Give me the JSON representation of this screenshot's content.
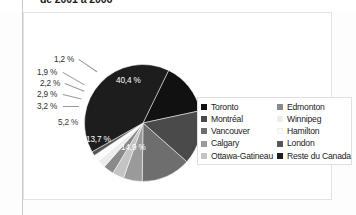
{
  "title": "de 2001 à 2006",
  "legend": {
    "columns": [
      {
        "items": [
          {
            "label": "Toronto",
            "color": "#111111"
          },
          {
            "label": "Montréal",
            "color": "#4a4a4a"
          },
          {
            "label": "Vancouver",
            "color": "#6e6e6e"
          },
          {
            "label": "Calgary",
            "color": "#9a9a9a"
          },
          {
            "label": "Ottawa-Gatineau",
            "color": "#c4c4c4"
          }
        ]
      },
      {
        "items": [
          {
            "label": "Edmonton",
            "color": "#8a8a8a"
          },
          {
            "label": "Winnipeg",
            "color": "#ececec"
          },
          {
            "label": "Hamilton",
            "color": "#fbfbfb"
          },
          {
            "label": "London",
            "color": "#565656"
          },
          {
            "label": "Reste du Canada",
            "color": "#1d1d1d"
          }
        ]
      }
    ]
  },
  "chart_data": {
    "type": "pie",
    "title": "de 2001 à 2006",
    "xlabel": "",
    "ylabel": "",
    "units": "percent",
    "decimal_separator": ",",
    "legend_position": "right",
    "grid": false,
    "categories": [
      "Toronto",
      "Montréal",
      "Vancouver",
      "Calgary",
      "Ottawa-Gatineau",
      "Edmonton",
      "Winnipeg",
      "Hamilton",
      "London",
      "Reste du Canada"
    ],
    "values": [
      14.4,
      14.9,
      13.7,
      5.2,
      3.2,
      2.9,
      2.2,
      1.9,
      1.2,
      40.4
    ],
    "colors": [
      "#111111",
      "#4a4a4a",
      "#6e6e6e",
      "#9a9a9a",
      "#c4c4c4",
      "#8a8a8a",
      "#ececec",
      "#fbfbfb",
      "#565656",
      "#1d1d1d"
    ],
    "data_labels": [
      "14,4 %",
      "14,9 %",
      "13,7 %",
      "5,2 %",
      "3,2 %",
      "2,9 %",
      "2,2 %",
      "1,9 %",
      "1,2 %",
      "40,4 %"
    ],
    "total": 100.0
  },
  "labels": {
    "toronto": "14,4 %",
    "montreal": "14,9 %",
    "vancouver": "13,7 %",
    "calgary": "5,2 %",
    "ottawa_gatineau": "3,2 %",
    "edmonton": "2,9 %",
    "winnipeg": "2,2 %",
    "hamilton": "1,9 %",
    "london": "1,2 %",
    "reste": "40,4 %"
  }
}
